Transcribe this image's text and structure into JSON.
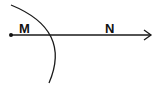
{
  "diagram": {
    "type": "geometry-ray-with-arc",
    "stroke_color": "#1a1a1a",
    "background": "#ffffff",
    "start_point": {
      "x": 11,
      "y": 35,
      "label": ""
    },
    "ray": {
      "x1": 11,
      "y1": 35,
      "x2": 151,
      "y2": 35,
      "arrow": "right"
    },
    "labels": [
      {
        "text": "M",
        "x": 19,
        "y": 33
      },
      {
        "text": "N",
        "x": 105,
        "y": 33
      }
    ],
    "arc": {
      "start": [
        11,
        5
      ],
      "control": [
        72,
        38
      ],
      "end": [
        49,
        83
      ]
    }
  }
}
